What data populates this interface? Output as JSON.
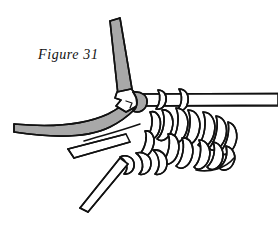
{
  "figure": {
    "caption": "Figure 31",
    "background_color": "#ffffff",
    "line_color": "#111111",
    "yarn_gray_fill": "#a8a8a8",
    "yarn_white_fill": "#ffffff",
    "stroke_width": 1.6
  },
  "elements": {
    "working_yarn_vertical": {
      "name": "gray working yarn, upper vertical strand",
      "fill": "#a8a8a8",
      "description": "gray strand descending from top, flat angled cut end at top"
    },
    "working_yarn_curve": {
      "name": "gray working yarn, left curving strand",
      "fill": "#a8a8a8",
      "description": "gray strand sweeping from left edge in a shallow arc up to the hook"
    },
    "hook": {
      "name": "crochet hook tip",
      "fill": "#ffffff",
      "description": "pointed white hook head engaging the gray loop"
    },
    "foundation_bar": {
      "name": "foundation chain bar",
      "fill": "#ffffff",
      "description": "horizontal double-line white band running to the right edge"
    },
    "stitch_cluster": {
      "name": "cluster of worked stitches",
      "fill": "#ffffff",
      "loop_count": 18,
      "description": "group of diagonal oval loops forming completed stitches"
    },
    "chain_row": {
      "name": "lower chain of loops",
      "fill": "#ffffff",
      "description": "horizontal chain of oval loops beneath the cluster"
    },
    "tail_upper": {
      "name": "upper white yarn tail",
      "fill": "#ffffff",
      "description": "white ribbon tail trailing down-left with angled cut end"
    },
    "tail_lower": {
      "name": "lower white yarn tail",
      "fill": "#ffffff",
      "description": "second white ribbon tail trailing down-left with angled cut end"
    }
  }
}
